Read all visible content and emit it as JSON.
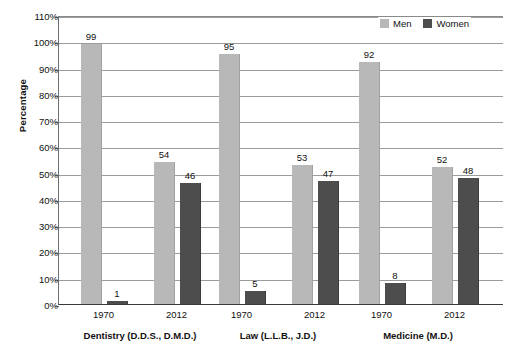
{
  "chart_data": {
    "type": "bar",
    "title": "",
    "xlabel": "",
    "ylabel": "Percentage",
    "ylim": [
      0,
      110
    ],
    "ytick_step": 10,
    "ytick_labels": [
      "0%",
      "10%",
      "20%",
      "30%",
      "40%",
      "50%",
      "60%",
      "70%",
      "80%",
      "90%",
      "100%",
      "110%"
    ],
    "grid": true,
    "legend_position": "top-right",
    "legend": [
      "Men",
      "Women"
    ],
    "groups": [
      {
        "label": "Dentistry (D.D.S., D.M.D.)",
        "years": [
          {
            "year": "1970",
            "men": 99,
            "women": 1
          },
          {
            "year": "2012",
            "men": 54,
            "women": 46
          }
        ]
      },
      {
        "label": "Law (L.L.B., J.D.)",
        "years": [
          {
            "year": "1970",
            "men": 95,
            "women": 5
          },
          {
            "year": "2012",
            "men": 53,
            "women": 47
          }
        ]
      },
      {
        "label": "Medicine (M.D.)",
        "years": [
          {
            "year": "1970",
            "men": 92,
            "women": 8
          },
          {
            "year": "2012",
            "men": 52,
            "women": 48
          }
        ]
      }
    ],
    "series": [
      {
        "name": "Men",
        "values": [
          99,
          54,
          95,
          53,
          92,
          52
        ]
      },
      {
        "name": "Women",
        "values": [
          1,
          46,
          5,
          47,
          8,
          48
        ]
      }
    ],
    "categories": [
      "Dentistry 1970",
      "Dentistry 2012",
      "Law 1970",
      "Law 2012",
      "Medicine 1970",
      "Medicine 2012"
    ],
    "colors": {
      "men": "#b8b8b8",
      "women": "#4d4d4d",
      "grid": "#9b9b9b",
      "axis": "#3a3a3a",
      "text": "#111111",
      "background": "#ffffff"
    }
  }
}
